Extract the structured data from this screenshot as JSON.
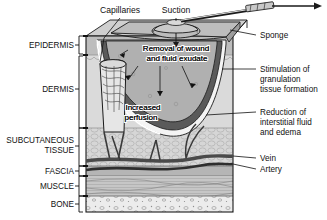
{
  "figure": {
    "caption": ""
  },
  "colors": {
    "outline": "#1a1a1a",
    "epidermis": "#b9b9b9",
    "dermis": "#dcdcdc",
    "subcutaneous": "#d2d2d2",
    "fascia": "#9a9a9a",
    "muscle": "#c4c4c4",
    "bone": "#e8e8e8",
    "sponge": "#a9a9a9",
    "sponge_top": "#bdbdbd",
    "wound_bed": "#4a4a4a",
    "exudate": "#f2f2f2",
    "vessel": "#3a3a3a",
    "text": "#111111"
  },
  "labels_left": [
    {
      "id": "epidermis",
      "text": "EPIDERMIS",
      "x": 52,
      "y": 46
    },
    {
      "id": "dermis",
      "text": "DERMIS",
      "x": 52,
      "y": 89
    },
    {
      "id": "subcutaneous",
      "text": "SUBCUTANEOUS",
      "x": 52,
      "y": 141
    },
    {
      "id": "subcutaneous2",
      "text": "TISSUE",
      "x": 52,
      "y": 151
    },
    {
      "id": "fascia",
      "text": "FASCIA",
      "x": 52,
      "y": 172
    },
    {
      "id": "muscle",
      "text": "MUSCLE",
      "x": 52,
      "y": 185
    },
    {
      "id": "bone",
      "text": "BONE",
      "x": 52,
      "y": 205
    }
  ],
  "labels_right": [
    {
      "id": "sponge",
      "text": "Sponge",
      "x": 258,
      "y": 38
    },
    {
      "id": "stimulation-1",
      "text": "Stimulation of",
      "x": 258,
      "y": 69
    },
    {
      "id": "stimulation-2",
      "text": "granulation",
      "x": 258,
      "y": 81
    },
    {
      "id": "stimulation-3",
      "text": "tissue formation",
      "x": 258,
      "y": 93
    },
    {
      "id": "reduction-1",
      "text": "Reduction of",
      "x": 258,
      "y": 112
    },
    {
      "id": "reduction-2",
      "text": "interstitial fluid",
      "x": 258,
      "y": 124
    },
    {
      "id": "reduction-3",
      "text": "and edema",
      "x": 258,
      "y": 136
    },
    {
      "id": "vein",
      "text": "Vein",
      "x": 258,
      "y": 161
    },
    {
      "id": "artery",
      "text": "Artery",
      "x": 258,
      "y": 172
    }
  ],
  "labels_top": [
    {
      "id": "capillaries",
      "text": "Capillaries",
      "x": 108,
      "y": 12
    },
    {
      "id": "suction",
      "text": "Suction",
      "x": 163,
      "y": 12
    }
  ],
  "labels_inner": [
    {
      "id": "removal-1",
      "text": "Removal of wound",
      "x": 136,
      "y": 52
    },
    {
      "id": "removal-2",
      "text": "and fluid exudate",
      "x": 138,
      "y": 62
    },
    {
      "id": "perfusion-1",
      "text": "Increased",
      "x": 130,
      "y": 108
    },
    {
      "id": "perfusion-2",
      "text": "perfusion",
      "x": 130,
      "y": 118
    }
  ],
  "layer_brackets": [
    {
      "id": "epidermis",
      "y1": 36,
      "y2": 54
    },
    {
      "id": "dermis",
      "y1": 56,
      "y2": 128
    },
    {
      "id": "subcutaneous",
      "y1": 128,
      "y2": 166
    },
    {
      "id": "fascia",
      "y1": 166,
      "y2": 176
    },
    {
      "id": "muscle",
      "y1": 176,
      "y2": 196
    },
    {
      "id": "bone",
      "y1": 196,
      "y2": 212
    }
  ]
}
